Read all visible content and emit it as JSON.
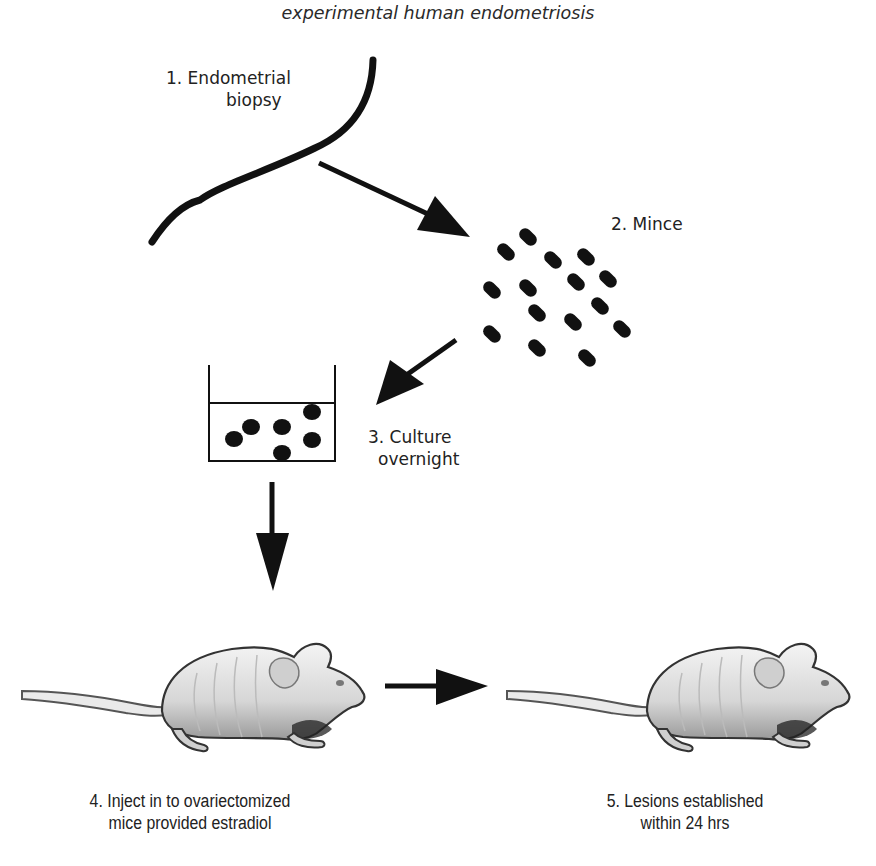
{
  "title": "experimental human endometriosis",
  "steps": [
    {
      "number": "1.",
      "label_line1": "1. Endometrial",
      "label_line2": "biopsy"
    },
    {
      "number": "2.",
      "label_line1": "2. Mince"
    },
    {
      "number": "3.",
      "label_line1": "3. Culture",
      "label_line2": "overnight"
    },
    {
      "number": "4.",
      "label_line1": "4. Inject in to ovariectomized",
      "label_line2": "mice provided estradiol"
    },
    {
      "number": "5.",
      "label_line1": "5. Lesions established",
      "label_line2": "within 24 hrs"
    }
  ],
  "icons": {
    "biopsy": "tissue-strip-icon",
    "mince": "tissue-fragments-icon",
    "culture": "culture-dish-icon",
    "mouse": "nude-mouse-icon"
  },
  "colors": {
    "ink": "#111111",
    "background": "#ffffff",
    "mouse_body": "#d9d9d9",
    "mouse_outline": "#333333"
  }
}
